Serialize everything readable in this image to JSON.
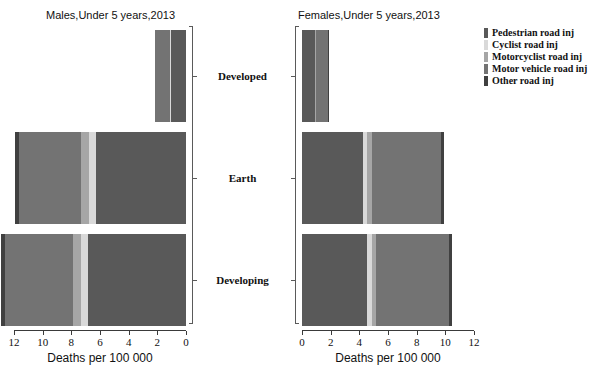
{
  "chart_data": {
    "type": "bar",
    "orientation": "horizontal",
    "subtype": "stacked-bar-pyramid",
    "categories": [
      "Developed",
      "Earth",
      "Developing"
    ],
    "xlabel": "Deaths per 100 000",
    "ylabel": "",
    "xlim": [
      0,
      12
    ],
    "xticks": [
      0,
      2,
      4,
      6,
      8,
      10,
      12
    ],
    "grid": false,
    "legend_position": "right",
    "series": [
      {
        "name": "Pedestrian road inj",
        "color": "#595959"
      },
      {
        "name": "Cyclist  road inj",
        "color": "#d9d9d9"
      },
      {
        "name": "Motorcyclist road inj",
        "color": "#a6a6a6"
      },
      {
        "name": "Motor vehicle road inj",
        "color": "#737373"
      },
      {
        "name": "Other road inj",
        "color": "#404040"
      }
    ],
    "panels": [
      {
        "id": "males",
        "title": "Males,Under 5 years,2013",
        "axis_reversed": true,
        "axis_ticks": [
          12,
          10,
          8,
          6,
          4,
          2,
          0
        ],
        "axis_title": "Deaths per 100 000",
        "rows": [
          {
            "category": "Developed",
            "values": [
              1.05,
              0.05,
              0.05,
              1.0,
              0.05
            ],
            "total": 2.2
          },
          {
            "category": "Earth",
            "values": [
              6.3,
              0.45,
              0.55,
              4.35,
              0.25
            ],
            "total": 11.9
          },
          {
            "category": "Developing",
            "values": [
              6.85,
              0.45,
              0.6,
              4.7,
              0.3
            ],
            "total": 12.9
          }
        ]
      },
      {
        "id": "females",
        "title": "Females,Under 5 years,2013",
        "axis_reversed": false,
        "axis_ticks": [
          0,
          2,
          4,
          6,
          8,
          10,
          12
        ],
        "axis_title": "Deaths per 100 000",
        "rows": [
          {
            "category": "Developed",
            "values": [
              0.9,
              0.04,
              0.04,
              0.82,
              0.05
            ],
            "total": 1.85
          },
          {
            "category": "Earth",
            "values": [
              4.25,
              0.3,
              0.3,
              4.85,
              0.2
            ],
            "total": 9.9
          },
          {
            "category": "Developing",
            "values": [
              4.55,
              0.3,
              0.3,
              5.1,
              0.2
            ],
            "total": 10.45
          }
        ]
      }
    ]
  },
  "legend": {
    "items": [
      {
        "label": "Pedestrian road inj",
        "color": "#595959"
      },
      {
        "label": "Cyclist  road inj",
        "color": "#d9d9d9"
      },
      {
        "label": "Motorcyclist road inj",
        "color": "#a6a6a6"
      },
      {
        "label": "Motor vehicle road inj",
        "color": "#737373"
      },
      {
        "label": "Other road inj",
        "color": "#404040"
      }
    ]
  }
}
